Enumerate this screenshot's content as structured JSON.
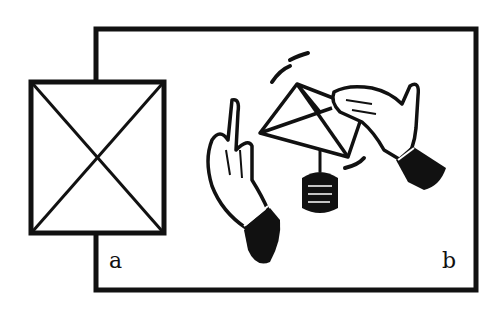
{
  "diagram": {
    "labels": {
      "a": "a",
      "b": "b"
    },
    "colors": {
      "ink": "#111111",
      "paper": "#ffffff"
    },
    "panel_a": {
      "description": "empty square with diagonal cross (placeholder)"
    },
    "panel_b": {
      "description": "two hands beside a tilted folded-paper square with a hanging weight, motion arcs"
    }
  }
}
